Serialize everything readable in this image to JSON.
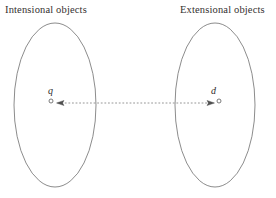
{
  "figure": {
    "background_color": "#ffffff",
    "stroke_color": "#6b6b6b",
    "text_color": "#34302f",
    "headings": {
      "left": "Intensional objects",
      "right": "Extensional objects"
    },
    "regions": [
      {
        "id": "intensional",
        "shape": "ellipse",
        "cx": 55,
        "cy": 105,
        "rx": 41,
        "ry": 82
      },
      {
        "id": "extensional",
        "shape": "ellipse",
        "cx": 215,
        "cy": 105,
        "rx": 40,
        "ry": 82
      }
    ],
    "nodes": [
      {
        "id": "q",
        "label": "q",
        "marker": "open-circle",
        "cx": 51,
        "cy": 101,
        "r": 2
      },
      {
        "id": "d",
        "label": "d",
        "marker": "open-circle",
        "cx": 219,
        "cy": 101,
        "r": 2
      }
    ],
    "connector": {
      "style": "dotted",
      "direction": "bidirectional",
      "x_start": 58,
      "x_end": 213,
      "y": 103,
      "arrowheads": [
        "left",
        "right"
      ]
    }
  }
}
